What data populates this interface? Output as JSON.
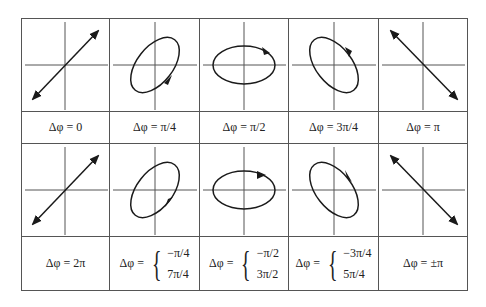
{
  "figure": {
    "rows": [
      {
        "cells": [
          {
            "shape": "line",
            "slope": "positive",
            "arrows": "both",
            "label": "Δφ = 0"
          },
          {
            "shape": "ellipse",
            "tilt": "positive",
            "rotation": "counterclockwise",
            "label": "Δφ = π/4"
          },
          {
            "shape": "ellipse",
            "tilt": "none",
            "rotation": "counterclockwise",
            "label": "Δφ = π/2"
          },
          {
            "shape": "ellipse",
            "tilt": "negative",
            "rotation": "counterclockwise",
            "label": "Δφ = 3π/4"
          },
          {
            "shape": "line",
            "slope": "negative",
            "arrows": "both",
            "label": "Δφ = π"
          }
        ]
      },
      {
        "cells": [
          {
            "shape": "line",
            "slope": "positive",
            "arrows": "both",
            "label": "Δφ = 2π"
          },
          {
            "shape": "ellipse",
            "tilt": "positive",
            "rotation": "clockwise",
            "label_lhs": "Δφ =",
            "cases": [
              "−π/4",
              "7π/4"
            ]
          },
          {
            "shape": "ellipse",
            "tilt": "none",
            "rotation": "clockwise",
            "label_lhs": "Δφ =",
            "cases": [
              "−π/2",
              "3π/2"
            ]
          },
          {
            "shape": "ellipse",
            "tilt": "negative",
            "rotation": "clockwise",
            "label_lhs": "Δφ =",
            "cases": [
              "−3π/4",
              "5π/4"
            ]
          },
          {
            "shape": "line",
            "slope": "negative",
            "arrows": "both",
            "label": "Δφ = ±π"
          }
        ]
      }
    ],
    "colors": {
      "line": "#1a1a1a",
      "axis": "#555555",
      "border": "#555555"
    }
  }
}
